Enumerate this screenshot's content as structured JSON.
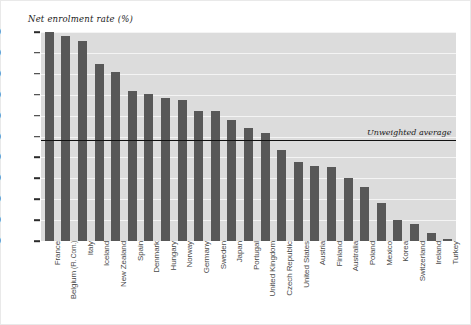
{
  "chart_data": {
    "type": "bar",
    "title": "Net enrolment rate (%)",
    "xlabel": "",
    "ylabel": "Net enrolment rate (%)",
    "ylim": [
      0,
      100
    ],
    "yticks": [
      0,
      10,
      20,
      30,
      40,
      50,
      60,
      70,
      80,
      90,
      100
    ],
    "grid": true,
    "legend": "none",
    "categories": [
      "France",
      "Belgium (Fl. Com.)",
      "Italy",
      "Iceland",
      "New Zealand",
      "Spain",
      "Denmark",
      "Hungary",
      "Norway",
      "Germany",
      "Sweden",
      "Japan",
      "Portugal",
      "United Kingdom",
      "Czech Republic",
      "United States",
      "Austria",
      "Finland",
      "Australia",
      "Poland",
      "Mexico",
      "Korea",
      "Switzerland",
      "Ireland",
      "Turkey"
    ],
    "values": [
      100,
      98,
      95.5,
      84.5,
      81,
      72,
      70.5,
      68.5,
      67.5,
      62,
      62,
      58,
      54,
      51.5,
      43.5,
      38,
      36,
      35.5,
      30,
      26,
      18,
      10,
      8,
      4,
      1
    ],
    "annotations": [
      {
        "label": "Unweighted average",
        "value": 48.5,
        "type": "hline"
      }
    ]
  },
  "axis": {
    "tick_labels": [
      "100",
      "90",
      "80",
      "70",
      "60",
      "50",
      "40",
      "30",
      "20",
      "10",
      "0"
    ]
  },
  "labels": {
    "belgium_main": "Belgium",
    "belgium_sub": "(Fl. Com.)"
  },
  "colors": {
    "bar": "#585858",
    "plot_background": "#dcdcdc",
    "gridline": "#f4f4f4",
    "average_line": "#111111",
    "text": "#1a1a1a",
    "xlabel_text": "#4a4a4a",
    "figure_border": "#e9e9e9"
  }
}
